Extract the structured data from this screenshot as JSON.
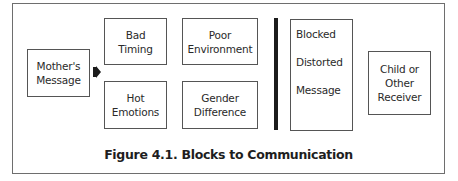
{
  "figure": {
    "caption": "Figure 4.1. Blocks to Communication",
    "source": {
      "lines": [
        "Mother's",
        "Message"
      ]
    },
    "connector": {
      "icon": "arrow-right-icon"
    },
    "blocks": [
      {
        "lines": [
          "Bad",
          "Timing"
        ]
      },
      {
        "lines": [
          "Poor",
          "Environment"
        ]
      },
      {
        "lines": [
          "Hot",
          "Emotions"
        ]
      },
      {
        "lines": [
          "Gender",
          "Difference"
        ]
      }
    ],
    "barrier": {
      "label": "barrier-bar"
    },
    "result": {
      "lines": [
        "Blocked",
        "Distorted",
        "Message"
      ]
    },
    "receiver": {
      "lines": [
        "Child or",
        "Other",
        "Receiver"
      ]
    }
  }
}
